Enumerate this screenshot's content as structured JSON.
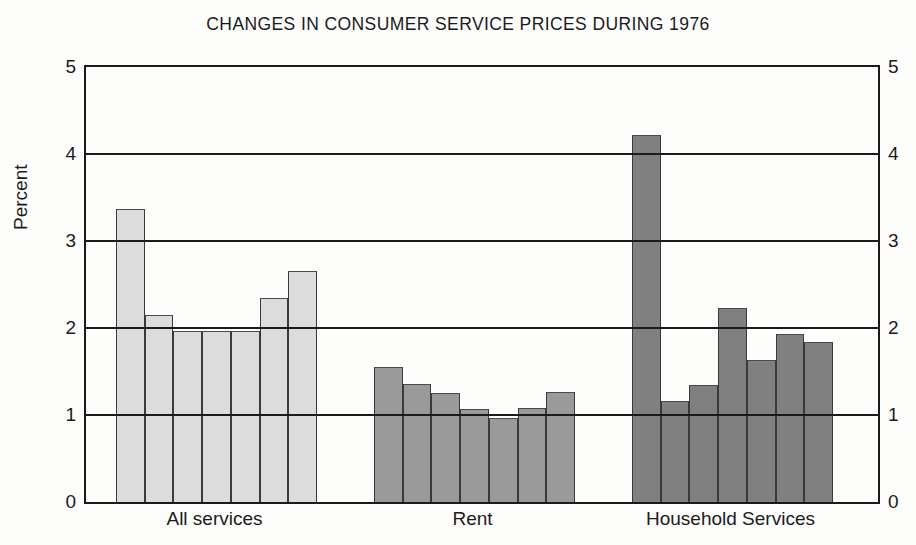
{
  "chart_data": {
    "type": "bar",
    "title": "CHANGES IN CONSUMER SERVICE PRICES DURING 1976",
    "xlabel": "",
    "ylabel": "Percent",
    "ylim": [
      0,
      5
    ],
    "yticks": [
      "0",
      "1",
      "2",
      "3",
      "4",
      "5"
    ],
    "grid": true,
    "legend": "none",
    "dual_y_axis": true,
    "categories": [
      "All services",
      "Rent",
      "Household Services"
    ],
    "groups": [
      {
        "name": "All services",
        "color": "#dcdcdc",
        "values": [
          3.37,
          2.15,
          1.97,
          1.97,
          1.97,
          2.35,
          2.66
        ]
      },
      {
        "name": "Rent",
        "color": "#9a9a9a",
        "values": [
          1.55,
          1.36,
          1.25,
          1.07,
          0.96,
          1.08,
          1.27
        ]
      },
      {
        "name": "Household Services",
        "color": "#808080",
        "values": [
          4.22,
          1.16,
          1.35,
          2.23,
          1.63,
          1.93,
          1.84
        ]
      }
    ]
  },
  "axis": {
    "left_ticks": [
      "5",
      "4",
      "3",
      "2",
      "1",
      "0"
    ],
    "right_ticks": [
      "5",
      "4",
      "3",
      "2",
      "1",
      "0"
    ]
  }
}
